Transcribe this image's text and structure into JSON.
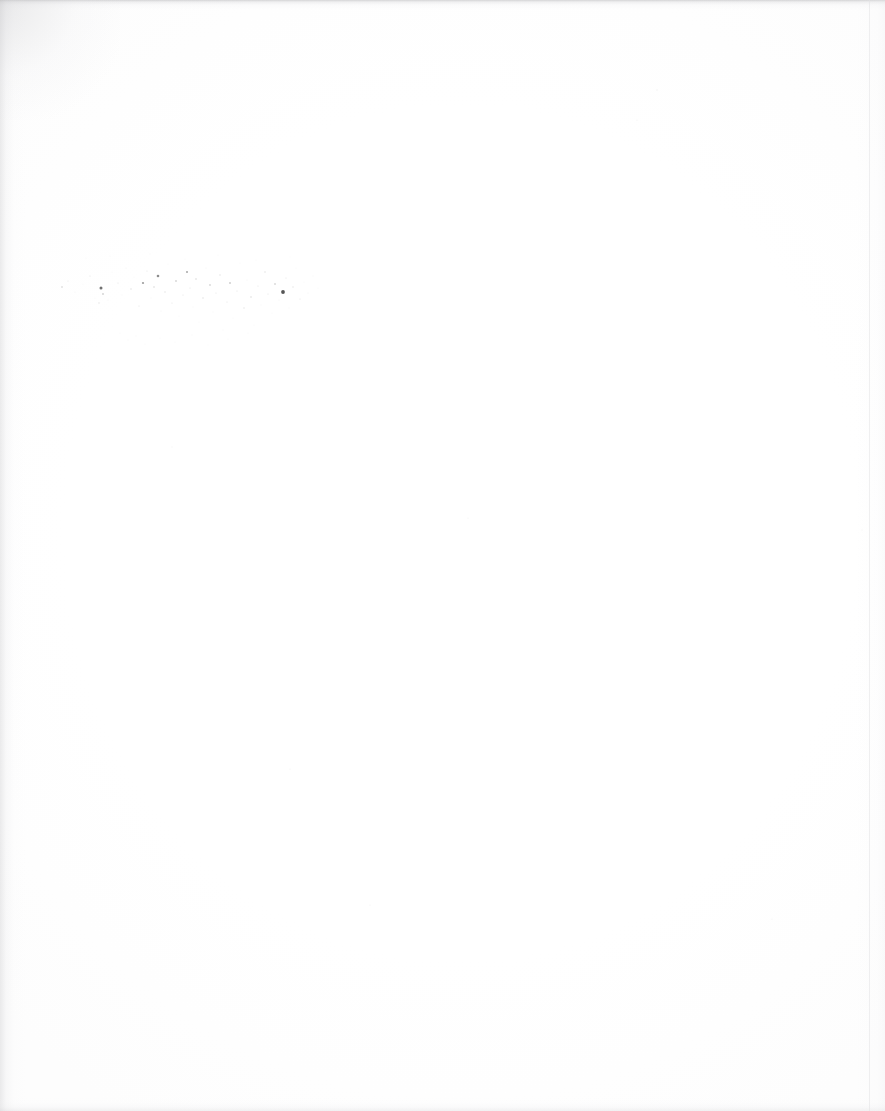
{
  "page": {
    "kind": "scanned-blank-page",
    "width": 885,
    "height": 1111,
    "background_color": "#ffffff",
    "paper_tone_color": "#fefefe",
    "has_text": false,
    "has_header": false,
    "has_footer": false,
    "has_page_number": false,
    "has_figures": false,
    "has_tables": false,
    "has_rules_or_borders": false,
    "description": "Blank scanned sheet, near-white throughout with no legible printed content."
  },
  "edges": {
    "top_band": {
      "name": "top-scan-shadow",
      "thickness_px": 10,
      "color": "#ababae"
    },
    "left_band": {
      "name": "left-scan-shadow",
      "thickness_px": 26,
      "color": "#c4c4c7"
    },
    "bottom_band": {
      "name": "bottom-scan-shadow",
      "thickness_px": 14,
      "color": "#d2d2d5"
    },
    "right_band": {
      "name": "right-scan-shadow",
      "thickness_px": 30,
      "color": "#e8e8eb"
    },
    "right_sheet_line": {
      "name": "sheet-right-edge-line",
      "x_px": 869,
      "color": "#e1e1e4"
    }
  },
  "artifact": {
    "name": "speckle-noise-cluster",
    "type": "scanner-noise",
    "label": "Diffuse field of isolated dark specks; no letterforms or stroke continuity.",
    "legible": false,
    "bounds": {
      "x": 55,
      "y": 252,
      "width": 268,
      "height": 100
    },
    "speck_color_dark": "#3a3a3a",
    "speck_color_mid": "#8d8d8d",
    "speck_color_light": "#c9c9c9",
    "specks": [
      {
        "x": 62,
        "y": 287,
        "r": 0.8,
        "o": 0.42
      },
      {
        "x": 68,
        "y": 281,
        "r": 0.5,
        "o": 0.22
      },
      {
        "x": 75,
        "y": 292,
        "r": 0.6,
        "o": 0.2
      },
      {
        "x": 83,
        "y": 284,
        "r": 0.5,
        "o": 0.17
      },
      {
        "x": 90,
        "y": 276,
        "r": 0.6,
        "o": 0.22
      },
      {
        "x": 95,
        "y": 298,
        "r": 0.5,
        "o": 0.16
      },
      {
        "x": 101,
        "y": 288,
        "r": 1.5,
        "o": 0.72
      },
      {
        "x": 103,
        "y": 294,
        "r": 0.9,
        "o": 0.4
      },
      {
        "x": 99,
        "y": 303,
        "r": 0.7,
        "o": 0.26
      },
      {
        "x": 108,
        "y": 300,
        "r": 0.6,
        "o": 0.2
      },
      {
        "x": 112,
        "y": 272,
        "r": 0.5,
        "o": 0.17
      },
      {
        "x": 118,
        "y": 283,
        "r": 0.6,
        "o": 0.24
      },
      {
        "x": 122,
        "y": 295,
        "r": 0.5,
        "o": 0.18
      },
      {
        "x": 126,
        "y": 268,
        "r": 0.6,
        "o": 0.21
      },
      {
        "x": 131,
        "y": 289,
        "r": 0.7,
        "o": 0.27
      },
      {
        "x": 134,
        "y": 277,
        "r": 0.5,
        "o": 0.16
      },
      {
        "x": 139,
        "y": 306,
        "r": 0.6,
        "o": 0.22
      },
      {
        "x": 143,
        "y": 283,
        "r": 1.1,
        "o": 0.5
      },
      {
        "x": 147,
        "y": 271,
        "r": 0.6,
        "o": 0.23
      },
      {
        "x": 151,
        "y": 298,
        "r": 0.5,
        "o": 0.18
      },
      {
        "x": 154,
        "y": 287,
        "r": 0.8,
        "o": 0.33
      },
      {
        "x": 158,
        "y": 276,
        "r": 1.3,
        "o": 0.58
      },
      {
        "x": 161,
        "y": 311,
        "r": 0.6,
        "o": 0.21
      },
      {
        "x": 165,
        "y": 292,
        "r": 0.7,
        "o": 0.28
      },
      {
        "x": 168,
        "y": 264,
        "r": 0.5,
        "o": 0.16
      },
      {
        "x": 172,
        "y": 303,
        "r": 0.6,
        "o": 0.23
      },
      {
        "x": 176,
        "y": 281,
        "r": 0.9,
        "o": 0.38
      },
      {
        "x": 179,
        "y": 316,
        "r": 0.5,
        "o": 0.17
      },
      {
        "x": 183,
        "y": 295,
        "r": 0.6,
        "o": 0.22
      },
      {
        "x": 187,
        "y": 272,
        "r": 1.0,
        "o": 0.45
      },
      {
        "x": 190,
        "y": 288,
        "r": 0.6,
        "o": 0.24
      },
      {
        "x": 193,
        "y": 307,
        "r": 0.5,
        "o": 0.18
      },
      {
        "x": 196,
        "y": 279,
        "r": 0.8,
        "o": 0.32
      },
      {
        "x": 199,
        "y": 322,
        "r": 0.5,
        "o": 0.16
      },
      {
        "x": 203,
        "y": 298,
        "r": 0.7,
        "o": 0.27
      },
      {
        "x": 206,
        "y": 268,
        "r": 0.6,
        "o": 0.21
      },
      {
        "x": 210,
        "y": 285,
        "r": 0.9,
        "o": 0.36
      },
      {
        "x": 213,
        "y": 312,
        "r": 0.5,
        "o": 0.18
      },
      {
        "x": 216,
        "y": 293,
        "r": 0.6,
        "o": 0.23
      },
      {
        "x": 220,
        "y": 275,
        "r": 0.7,
        "o": 0.28
      },
      {
        "x": 223,
        "y": 330,
        "r": 0.5,
        "o": 0.15
      },
      {
        "x": 227,
        "y": 302,
        "r": 0.6,
        "o": 0.22
      },
      {
        "x": 230,
        "y": 283,
        "r": 1.0,
        "o": 0.42
      },
      {
        "x": 233,
        "y": 318,
        "r": 0.5,
        "o": 0.17
      },
      {
        "x": 237,
        "y": 291,
        "r": 0.6,
        "o": 0.24
      },
      {
        "x": 240,
        "y": 263,
        "r": 0.5,
        "o": 0.16
      },
      {
        "x": 244,
        "y": 308,
        "r": 0.7,
        "o": 0.26
      },
      {
        "x": 247,
        "y": 280,
        "r": 0.6,
        "o": 0.21
      },
      {
        "x": 251,
        "y": 297,
        "r": 0.8,
        "o": 0.31
      },
      {
        "x": 254,
        "y": 325,
        "r": 0.5,
        "o": 0.16
      },
      {
        "x": 258,
        "y": 286,
        "r": 0.6,
        "o": 0.23
      },
      {
        "x": 261,
        "y": 305,
        "r": 0.5,
        "o": 0.18
      },
      {
        "x": 265,
        "y": 272,
        "r": 0.7,
        "o": 0.27
      },
      {
        "x": 268,
        "y": 294,
        "r": 0.6,
        "o": 0.22
      },
      {
        "x": 272,
        "y": 313,
        "r": 0.5,
        "o": 0.17
      },
      {
        "x": 275,
        "y": 284,
        "r": 0.9,
        "o": 0.35
      },
      {
        "x": 279,
        "y": 300,
        "r": 0.6,
        "o": 0.21
      },
      {
        "x": 283,
        "y": 292,
        "r": 1.9,
        "o": 0.86
      },
      {
        "x": 286,
        "y": 278,
        "r": 0.6,
        "o": 0.24
      },
      {
        "x": 289,
        "y": 308,
        "r": 0.5,
        "o": 0.18
      },
      {
        "x": 293,
        "y": 287,
        "r": 0.7,
        "o": 0.26
      },
      {
        "x": 296,
        "y": 268,
        "r": 0.5,
        "o": 0.16
      },
      {
        "x": 300,
        "y": 299,
        "r": 0.6,
        "o": 0.22
      },
      {
        "x": 304,
        "y": 282,
        "r": 0.5,
        "o": 0.17
      },
      {
        "x": 308,
        "y": 293,
        "r": 0.6,
        "o": 0.2
      },
      {
        "x": 313,
        "y": 276,
        "r": 0.5,
        "o": 0.15
      },
      {
        "x": 318,
        "y": 288,
        "r": 0.5,
        "o": 0.14
      },
      {
        "x": 120,
        "y": 333,
        "r": 0.5,
        "o": 0.16
      },
      {
        "x": 128,
        "y": 340,
        "r": 0.6,
        "o": 0.19
      },
      {
        "x": 136,
        "y": 336,
        "r": 0.5,
        "o": 0.15
      },
      {
        "x": 145,
        "y": 344,
        "r": 0.5,
        "o": 0.14
      },
      {
        "x": 160,
        "y": 338,
        "r": 0.5,
        "o": 0.16
      },
      {
        "x": 175,
        "y": 342,
        "r": 0.5,
        "o": 0.13
      },
      {
        "x": 192,
        "y": 335,
        "r": 0.5,
        "o": 0.15
      },
      {
        "x": 208,
        "y": 345,
        "r": 0.5,
        "o": 0.12
      },
      {
        "x": 228,
        "y": 339,
        "r": 0.5,
        "o": 0.14
      },
      {
        "x": 248,
        "y": 333,
        "r": 0.5,
        "o": 0.13
      },
      {
        "x": 86,
        "y": 258,
        "r": 0.5,
        "o": 0.14
      },
      {
        "x": 110,
        "y": 256,
        "r": 0.5,
        "o": 0.13
      },
      {
        "x": 150,
        "y": 254,
        "r": 0.5,
        "o": 0.15
      },
      {
        "x": 185,
        "y": 259,
        "r": 0.5,
        "o": 0.14
      },
      {
        "x": 218,
        "y": 255,
        "r": 0.5,
        "o": 0.13
      },
      {
        "x": 256,
        "y": 260,
        "r": 0.5,
        "o": 0.14
      },
      {
        "x": 290,
        "y": 257,
        "r": 0.5,
        "o": 0.12
      }
    ]
  },
  "stray_marks": [
    {
      "name": "stray-speck-upper-right",
      "x": 657,
      "y": 90,
      "r": 0.7,
      "o": 0.13
    },
    {
      "name": "stray-speck-mid-right",
      "x": 637,
      "y": 120,
      "r": 0.6,
      "o": 0.12
    },
    {
      "name": "stray-speck-center",
      "x": 468,
      "y": 518,
      "r": 0.6,
      "o": 0.1
    },
    {
      "name": "stray-speck-lower-left",
      "x": 172,
      "y": 447,
      "r": 0.6,
      "o": 0.11
    },
    {
      "name": "stray-speck-lower-mid",
      "x": 290,
      "y": 769,
      "r": 0.6,
      "o": 0.1
    },
    {
      "name": "stray-speck-bottom",
      "x": 370,
      "y": 905,
      "r": 0.6,
      "o": 0.1
    },
    {
      "name": "stray-speck-right-low",
      "x": 772,
      "y": 919,
      "r": 0.6,
      "o": 0.1
    },
    {
      "name": "stray-speck-far-right",
      "x": 862,
      "y": 530,
      "r": 0.6,
      "o": 0.11
    }
  ]
}
